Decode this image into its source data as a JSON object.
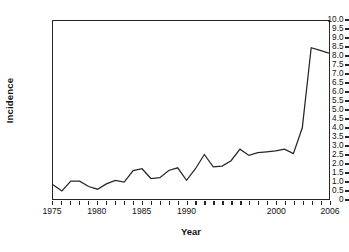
{
  "chart_data": {
    "type": "line",
    "title": "",
    "xlabel": "Year",
    "ylabel": "Incidence",
    "xlim": [
      1975,
      2006
    ],
    "ylim": [
      0,
      10
    ],
    "grid": false,
    "legend": null,
    "line_color": "#262626",
    "background_color": "#ffffff",
    "axis_color": "#262626",
    "y_ticks": [
      "10.0",
      "9.5",
      "9.0",
      "8.5",
      "8.0",
      "7.5",
      "7.0",
      "6.5",
      "6.0",
      "5.5",
      "5.0",
      "4.5",
      "4.0",
      "3.5",
      "3.0",
      "2.5",
      "2.0",
      "1.5",
      "1.0",
      "0.5",
      "0"
    ],
    "y_tick_values": [
      10.0,
      9.5,
      9.0,
      8.5,
      8.0,
      7.5,
      7.0,
      6.5,
      6.0,
      5.5,
      5.0,
      4.5,
      4.0,
      3.5,
      3.0,
      2.5,
      2.0,
      1.5,
      1.0,
      0.5,
      0
    ],
    "x_tick_values": [
      1975,
      1976,
      1977,
      1978,
      1979,
      1980,
      1981,
      1982,
      1983,
      1984,
      1985,
      1986,
      1987,
      1988,
      1989,
      1990,
      1991,
      1992,
      1993,
      1994,
      1995,
      1996,
      1997,
      1998,
      1999,
      2000,
      2001,
      2002,
      2003,
      2004,
      2005,
      2006
    ],
    "x_tick_labels": [
      {
        "value": 1975,
        "label": "1975"
      },
      {
        "value": 1980,
        "label": "1980"
      },
      {
        "value": 1985,
        "label": "1985"
      },
      {
        "value": 1990,
        "label": "1990"
      },
      {
        "value": 2000,
        "label": "2000"
      },
      {
        "value": 2006,
        "label": "2006"
      }
    ],
    "x": [
      1975,
      1976,
      1977,
      1978,
      1979,
      1980,
      1981,
      1982,
      1983,
      1984,
      1985,
      1986,
      1987,
      1988,
      1989,
      1990,
      1991,
      1992,
      1993,
      1994,
      1995,
      1996,
      1997,
      1998,
      1999,
      2000,
      2001,
      2002,
      2003,
      2004,
      2005,
      2006
    ],
    "values": [
      0.8,
      0.45,
      1.0,
      1.0,
      0.7,
      0.55,
      0.85,
      1.05,
      0.95,
      1.6,
      1.7,
      1.15,
      1.2,
      1.6,
      1.75,
      1.05,
      1.7,
      2.5,
      1.8,
      1.85,
      2.15,
      2.8,
      2.45,
      2.6,
      2.65,
      2.7,
      2.8,
      2.55,
      4.0,
      8.5,
      8.35,
      8.2
    ]
  }
}
